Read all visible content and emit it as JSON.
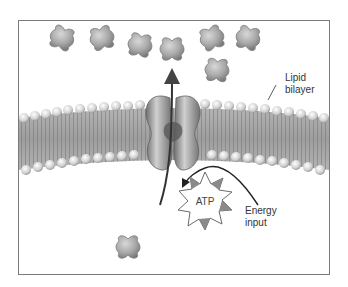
{
  "diagram": {
    "labels": {
      "lipid_bilayer_line1": "Lipid",
      "lipid_bilayer_line2": "bilayer",
      "energy_line1": "Energy",
      "energy_line2": "input",
      "atp": "ATP"
    },
    "colors": {
      "frame": "#7a7a7a",
      "molecule_fill": "#a9a9a9",
      "molecule_edge": "#7d7d7d",
      "phospholipid_head": "#d6d6d6",
      "tail": "#8c8c8c",
      "protein": "#9a9a9a",
      "atp_burst": "#8a8a8a",
      "arrow": "#555555"
    },
    "molecules_outside": [
      {
        "x": 62,
        "y": 38
      },
      {
        "x": 102,
        "y": 38
      },
      {
        "x": 140,
        "y": 45
      },
      {
        "x": 172,
        "y": 48
      },
      {
        "x": 212,
        "y": 38
      },
      {
        "x": 248,
        "y": 38
      },
      {
        "x": 217,
        "y": 70
      }
    ],
    "molecules_inside": [
      {
        "x": 128,
        "y": 247
      }
    ]
  }
}
